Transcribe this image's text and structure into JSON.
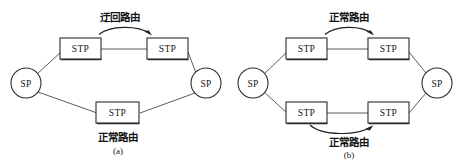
{
  "figure": {
    "background_color": "#ffffff",
    "line_color": "#2b2b2b",
    "text_color": "#141414",
    "width": 467,
    "height": 163
  },
  "panels": [
    {
      "id": "a",
      "caption": "(a)",
      "nodes": {
        "sp_left": "SP",
        "sp_right": "SP",
        "stp_top_left": "STP",
        "stp_top_right": "STP",
        "stp_bottom": "STP"
      },
      "annotations": {
        "top_route": "迂回路由",
        "bottom_route": "正常路由"
      }
    },
    {
      "id": "b",
      "caption": "(b)",
      "nodes": {
        "sp_left": "SP",
        "sp_right": "SP",
        "stp_top_left": "STP",
        "stp_top_right": "STP",
        "stp_bottom_left": "STP",
        "stp_bottom_right": "STP"
      },
      "annotations": {
        "top_route": "正常路由",
        "bottom_route": "正常路由"
      }
    }
  ]
}
